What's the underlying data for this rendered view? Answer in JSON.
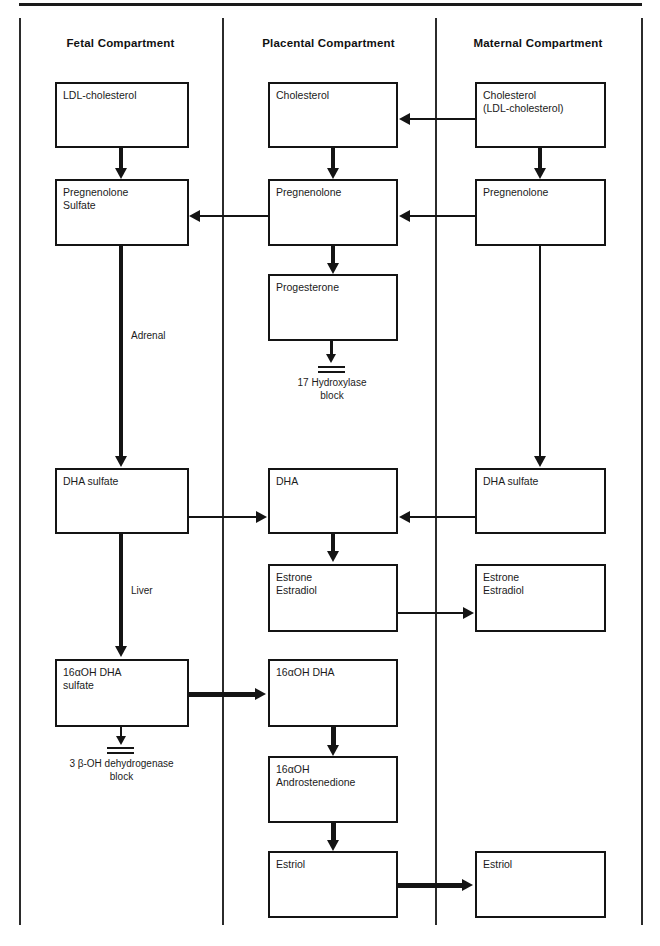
{
  "diagram": {
    "columns": [
      {
        "id": "fetal",
        "label": "Fetal Compartment"
      },
      {
        "id": "placental",
        "label": "Placental Compartment"
      },
      {
        "id": "maternal",
        "label": "Maternal Compartment"
      }
    ],
    "nodes": {
      "fetal_ldl": "LDL-cholesterol",
      "fetal_pregnenolone_sulfate": "Pregnenolone\nSulfate",
      "fetal_dha_sulfate": "DHA sulfate",
      "fetal_16oh_dha_sulfate": "16αOH DHA\nsulfate",
      "plac_cholesterol": "Cholesterol",
      "plac_pregnenolone": "Pregnenolone",
      "plac_progesterone": "Progesterone",
      "plac_dha": "DHA",
      "plac_estrone_estradiol": "Estrone\nEstradiol",
      "plac_16oh_dha": "16αOH DHA",
      "plac_16oh_androstenedione": "16αOH\nAndrostenedione",
      "plac_estriol": "Estriol",
      "mat_cholesterol": "Cholesterol\n(LDL-cholesterol)",
      "mat_pregnenolone": "Pregnenolone",
      "mat_dha_sulfate": "DHA sulfate",
      "mat_estrone_estradiol": "Estrone\nEstradiol",
      "mat_estriol": "Estriol"
    },
    "edge_labels": {
      "adrenal": "Adrenal",
      "liver": "Liver"
    },
    "blocks": {
      "hydroxylase": "17 Hydroxylase\nblock",
      "dehydrogenase": "3 β-OH dehydrogenase\nblock"
    },
    "colors": {
      "ink": "#141414",
      "background": "#ffffff",
      "rule": "#2b2b2b"
    }
  }
}
